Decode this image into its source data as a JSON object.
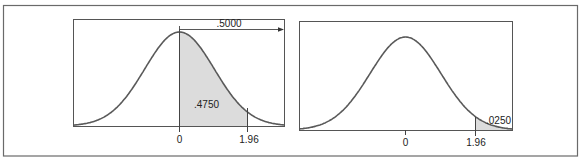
{
  "chart_data": [
    {
      "type": "area",
      "title": "",
      "description": "Standard normal curve, area between 0 and 1.96 shaded",
      "xlabel": "",
      "ylabel": "",
      "x_ticks": [
        "0",
        "1.96"
      ],
      "shaded_region": {
        "from": 0,
        "to": 1.96,
        "area": 0.475,
        "label": ".4750"
      },
      "annotations": [
        {
          "text": ".5000",
          "type": "arrow",
          "from": 0,
          "to": "+inf",
          "meaning": "area to the right of mean"
        }
      ],
      "mean": 0,
      "sd": 1,
      "grid": false
    },
    {
      "type": "area",
      "title": "",
      "description": "Standard normal curve, upper tail beyond 1.96 shaded",
      "xlabel": "",
      "ylabel": "",
      "x_ticks": [
        "0",
        "1.96"
      ],
      "shaded_region": {
        "from": 1.96,
        "to": "+inf",
        "area": 0.025,
        "label": ".0250"
      },
      "annotations": [],
      "mean": 0,
      "sd": 1,
      "grid": false
    }
  ],
  "left_panel": {
    "tick_zero": "0",
    "tick_z": "1.96",
    "shaded_label": ".4750",
    "arrow_label": ".5000"
  },
  "right_panel": {
    "tick_zero": "0",
    "tick_z": "1.96",
    "shaded_label": ".0250"
  }
}
